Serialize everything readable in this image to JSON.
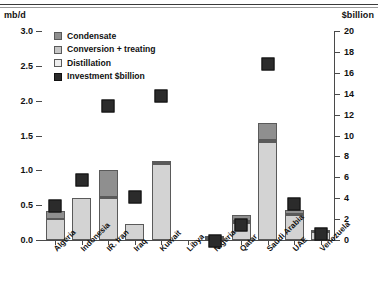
{
  "axes": {
    "left_unit": "mb/d",
    "right_unit": "$billion",
    "left_ticks": [
      "0.0",
      "0.5",
      "1.0",
      "1.5",
      "2.0",
      "2.5",
      "3.0"
    ],
    "right_ticks": [
      "0",
      "2",
      "4",
      "6",
      "8",
      "10",
      "12",
      "14",
      "16",
      "18",
      "20"
    ]
  },
  "legend": {
    "items": [
      {
        "label": "Condensate",
        "swatch": "cond"
      },
      {
        "label": "Conversion + treating",
        "swatch": "conv"
      },
      {
        "label": "Distillation",
        "swatch": "dist"
      },
      {
        "label": "Investment $billion",
        "swatch": "inv"
      }
    ]
  },
  "chart_data": {
    "type": "bar",
    "title": "",
    "xlabel": "",
    "ylabel": "mb/d",
    "y2label": "$billion",
    "ylim": [
      0.0,
      3.0
    ],
    "y2lim": [
      0,
      20
    ],
    "grid": false,
    "legend_position": "upper-left-inside",
    "categories": [
      "Algeria",
      "Indonesia",
      "IR. Iran",
      "Iraq",
      "Kuwait",
      "Libya",
      "Nigeria",
      "Qatar",
      "Saudi Arabia",
      "UAE",
      "Venezuela"
    ],
    "series": [
      {
        "name": "Distillation",
        "axis": "left",
        "values": [
          0.3,
          0.61,
          0.6,
          0.23,
          1.09,
          0.0,
          0.03,
          0.25,
          1.4,
          0.36,
          0.11
        ]
      },
      {
        "name": "Conversion + treating",
        "axis": "left",
        "values": [
          0.0,
          0.0,
          0.02,
          0.0,
          0.02,
          0.0,
          0.0,
          0.02,
          0.03,
          0.02,
          0.0
        ]
      },
      {
        "name": "Condensate",
        "axis": "left",
        "values": [
          0.11,
          0.0,
          0.38,
          0.0,
          0.02,
          0.0,
          0.01,
          0.09,
          0.25,
          0.05,
          0.01
        ]
      },
      {
        "name": "Investment $billion",
        "axis": "right",
        "values": [
          4.0,
          6.5,
          13.5,
          4.8,
          14.5,
          0.0,
          0.6,
          2.2,
          17.6,
          4.2,
          1.3
        ]
      }
    ],
    "stack_totals_mbd": [
      0.41,
      0.61,
      1.0,
      0.23,
      1.13,
      0.0,
      0.04,
      0.36,
      1.68,
      0.43,
      0.12
    ]
  }
}
